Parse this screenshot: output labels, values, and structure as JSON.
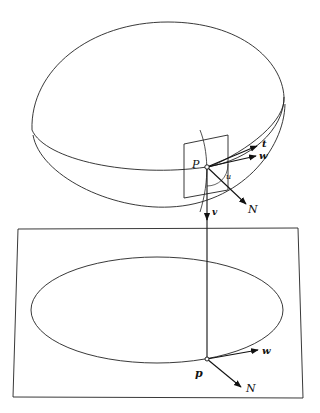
{
  "diagram": {
    "type": "geometric-projection",
    "labels": {
      "P": "P",
      "t": "t",
      "w_upper": "w",
      "N_upper": "N",
      "v": "v",
      "angle": "u",
      "p": "p",
      "w_lower": "w",
      "N_lower": "N"
    },
    "colors": {
      "stroke": "#222222",
      "background": "#ffffff"
    }
  }
}
